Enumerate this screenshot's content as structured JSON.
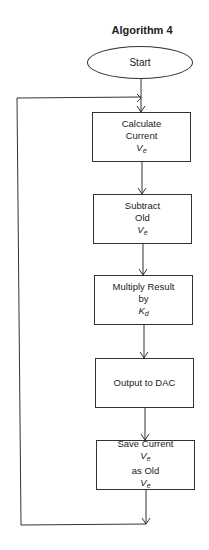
{
  "title": "Algorithm 4",
  "start": {
    "label": "Start",
    "shape": "ellipse"
  },
  "steps": [
    {
      "line1": "Calculate",
      "line2_pre": "Current ",
      "var": "V",
      "sub": "e",
      "line2_post": ""
    },
    {
      "line1": "Subtract",
      "line2_pre": "Old ",
      "var": "V",
      "sub": "e",
      "line2_post": ""
    },
    {
      "line1": "Multiply Result",
      "line2_pre": "by ",
      "var": "K",
      "sub": "d",
      "line2_post": ""
    },
    {
      "line1": "Output to DAC"
    },
    {
      "line1_pre": "Save Current ",
      "var1": "V",
      "sub1": "e",
      "line2_pre": "as Old ",
      "var": "V",
      "sub": "e"
    }
  ],
  "loop": {
    "description": "feedback loop from end of last step back to before first step"
  },
  "colors": {
    "stroke": "#333333",
    "background": "#ffffff",
    "text": "#222222"
  }
}
